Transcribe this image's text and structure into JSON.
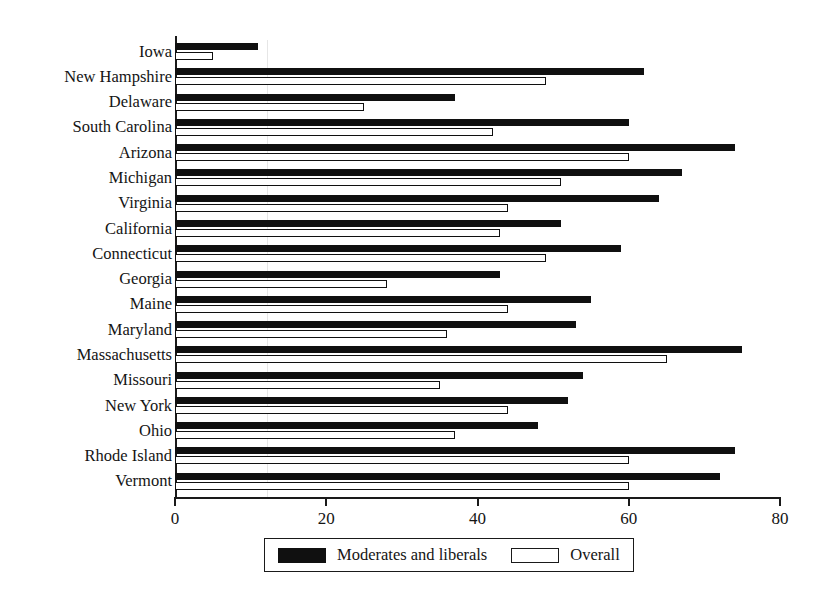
{
  "chart_data": {
    "type": "bar",
    "orientation": "horizontal",
    "title": "",
    "subtitle": "",
    "xlabel": "",
    "ylabel": "",
    "xlim": [
      0,
      80
    ],
    "xticks": [
      0,
      20,
      40,
      60,
      80
    ],
    "xtick_labels": [
      "0",
      "20",
      "40",
      "60",
      "80"
    ],
    "grid": false,
    "legend_position": "bottom-center",
    "categories": [
      "Iowa",
      "New Hampshire",
      "Delaware",
      "South Carolina",
      "Arizona",
      "Michigan",
      "Virginia",
      "California",
      "Connecticut",
      "Georgia",
      "Maine",
      "Maryland",
      "Massachusetts",
      "Missouri",
      "New York",
      "Ohio",
      "Rhode Island",
      "Vermont"
    ],
    "series": [
      {
        "name": "Moderates and liberals",
        "color": "#101010",
        "style": "filled",
        "values": [
          11,
          62,
          37,
          60,
          74,
          67,
          64,
          51,
          59,
          43,
          55,
          53,
          75,
          54,
          52,
          48,
          74,
          72
        ]
      },
      {
        "name": "Overall",
        "color": "#ffffff",
        "style": "outlined",
        "values": [
          5,
          49,
          25,
          42,
          60,
          51,
          44,
          43,
          49,
          28,
          44,
          36,
          65,
          35,
          44,
          37,
          60,
          60
        ]
      }
    ]
  },
  "legend": {
    "entries": [
      {
        "label": "Moderates and liberals",
        "swatch": "filled-black"
      },
      {
        "label": "Overall",
        "swatch": "outlined-white"
      }
    ]
  }
}
